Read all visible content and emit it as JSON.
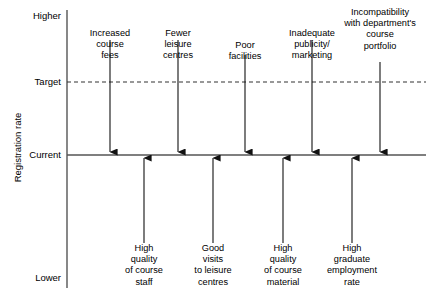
{
  "diagram": {
    "type": "force-field-analysis",
    "y_axis_title": "Registration rate",
    "axis_levels": [
      {
        "key": "higher",
        "label": "Higher",
        "y": 16
      },
      {
        "key": "target",
        "label": "Target",
        "y": 82
      },
      {
        "key": "current",
        "label": "Current",
        "y": 155
      },
      {
        "key": "lower",
        "label": "Lower",
        "y": 278
      }
    ],
    "axis": {
      "vertical_line_x": 67,
      "vertical_line_top": 10,
      "vertical_line_bottom": 288,
      "current_line_color": "#555555",
      "target_line_color": "#333333",
      "target_line_style": "dashed",
      "current_line_style": "solid",
      "current_line_x_start": 67,
      "current_line_x_end": 426,
      "target_line_x_start": 67,
      "target_line_x_end": 426
    },
    "restraining_forces": {
      "group_name": "restraining-forces-downward",
      "arrow_color": "#111111",
      "direction": "down",
      "items": [
        {
          "id": "increased-course-fees",
          "label": "Increased\ncourse\nfees",
          "x": 110,
          "tail_y": 40,
          "head_y": 152,
          "label_y": 28
        },
        {
          "id": "fewer-leisure-centres",
          "label": "Fewer\nleisure\ncentres",
          "x": 178,
          "tail_y": 40,
          "head_y": 152,
          "label_y": 28
        },
        {
          "id": "poor-facilities",
          "label": "Poor\nfacilities",
          "x": 245,
          "tail_y": 55,
          "head_y": 152,
          "label_y": 40
        },
        {
          "id": "inadequate-publicity",
          "label": "Inadequate\npublicity/\nmarketing",
          "x": 312,
          "tail_y": 40,
          "head_y": 152,
          "label_y": 28
        },
        {
          "id": "incompatibility-portfolio",
          "label": "Incompatibility\nwith department's\ncourse\nportfolio",
          "x": 380,
          "tail_y": 62,
          "head_y": 152,
          "label_y": 7
        }
      ]
    },
    "driving_forces": {
      "group_name": "driving-forces-upward",
      "arrow_color": "#111111",
      "direction": "up",
      "items": [
        {
          "id": "high-quality-course-staff",
          "label": "High\nquality\nof course\nstaff",
          "x": 144,
          "tail_y": 243,
          "head_y": 158,
          "label_y": 243
        },
        {
          "id": "good-visits-leisure-centres",
          "label": "Good\nvisits\nto leisure\ncentres",
          "x": 213,
          "tail_y": 243,
          "head_y": 158,
          "label_y": 243
        },
        {
          "id": "high-quality-course-material",
          "label": "High\nquality\nof course\nmaterial",
          "x": 283,
          "tail_y": 243,
          "head_y": 158,
          "label_y": 243
        },
        {
          "id": "high-graduate-employment",
          "label": "High\ngraduate\nemployment\nrate",
          "x": 352,
          "tail_y": 243,
          "head_y": 158,
          "label_y": 243
        }
      ]
    }
  }
}
